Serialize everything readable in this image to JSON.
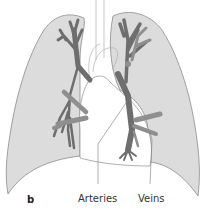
{
  "figure": {
    "panel_label": "b",
    "labels": {
      "arteries": "Arteries",
      "veins": "Veins"
    },
    "colors": {
      "lung_fill": "#dcdcdc",
      "lung_stroke": "#8c8c8c",
      "artery": "#6e6e6e",
      "vein": "#8f8f8f",
      "background": "#ffffff"
    },
    "structures": [
      "right-lung",
      "left-lung",
      "heart",
      "trachea",
      "aorta",
      "pulmonary-arteries",
      "pulmonary-veins"
    ]
  }
}
